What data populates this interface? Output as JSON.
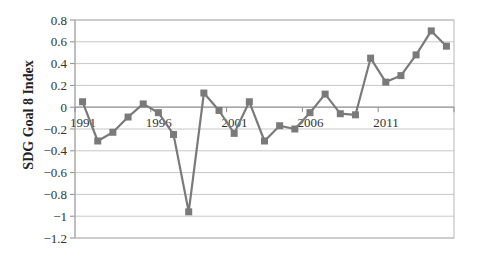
{
  "chart_data": {
    "type": "line",
    "title": "",
    "xlabel": "",
    "ylabel": "SDG Goal 8 Index",
    "ylim": [
      -1.2,
      0.8
    ],
    "yticks": [
      0.8,
      0.6,
      0.4,
      0.2,
      0,
      -0.2,
      -0.4,
      -0.6,
      -0.8,
      -1,
      -1.2
    ],
    "ytick_labels": [
      "0.8",
      "0.6",
      "0.4",
      "0.2",
      "0",
      "-0.2",
      "-0.4",
      "-0.6",
      "-0.8",
      "-1",
      "-1.2"
    ],
    "xtick_labels": [
      "1991",
      "1996",
      "2001",
      "2006",
      "2011"
    ],
    "grid": true,
    "legend": null,
    "x": [
      1991,
      1992,
      1993,
      1994,
      1995,
      1996,
      1997,
      1998,
      1999,
      2000,
      2001,
      2002,
      2003,
      2004,
      2005,
      2006,
      2007,
      2008,
      2009,
      2010,
      2011,
      2012,
      2013,
      2014,
      2015
    ],
    "series": [
      {
        "name": "SDG Goal 8 Index",
        "marker": "square",
        "color": "#7a7a7a",
        "values": [
          0.05,
          -0.31,
          -0.23,
          -0.09,
          0.03,
          -0.05,
          -0.25,
          -0.96,
          0.13,
          -0.03,
          -0.24,
          0.05,
          -0.31,
          -0.17,
          -0.2,
          -0.05,
          0.12,
          -0.06,
          -0.07,
          0.45,
          0.23,
          0.29,
          0.48,
          0.7,
          0.56
        ]
      }
    ]
  },
  "colors": {
    "line": "#7a7a7a",
    "marker": "#7a7a7a",
    "grid": "#c8c8c8",
    "axis": "#8c8c8c",
    "border": "#b8b8b8"
  }
}
